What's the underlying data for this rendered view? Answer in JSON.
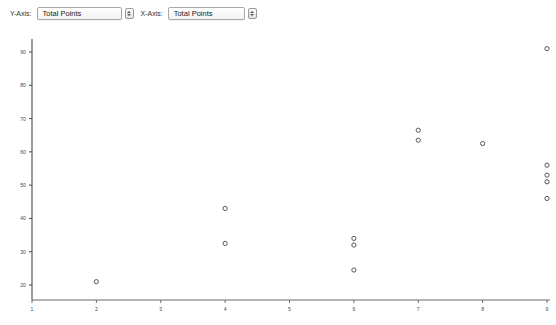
{
  "controls": {
    "y_axis": {
      "label": "Y-Axis:",
      "value": "Total Points",
      "stepper_icon": "stepper-updown-icon"
    },
    "x_axis": {
      "label": "X-Axis:",
      "value": "Total Points",
      "stepper_icon": "stepper-updown-icon"
    }
  },
  "chart_data": {
    "type": "scatter",
    "title": "",
    "xlabel": "Total Points",
    "ylabel": "Total Points",
    "xlim": [
      1,
      9
    ],
    "ylim": [
      15,
      95
    ],
    "xticks": [
      1,
      2,
      3,
      4,
      5,
      6,
      7,
      8,
      9
    ],
    "yticks": [
      20,
      30,
      40,
      50,
      60,
      70,
      80,
      90
    ],
    "xtick_labels": [
      "1",
      "2",
      "3",
      "4",
      "5",
      "6",
      "7",
      "8",
      "9"
    ],
    "ytick_labels": [
      "20",
      "30",
      "40",
      "50",
      "60",
      "70",
      "80",
      "90"
    ],
    "grid": false,
    "legend": null,
    "marker": "open-circle",
    "marker_color": "#555555",
    "axis_color": "#4a4a4a",
    "points": [
      {
        "x": 2,
        "y": 21
      },
      {
        "x": 4,
        "y": 43
      },
      {
        "x": 4,
        "y": 32.5
      },
      {
        "x": 6,
        "y": 34
      },
      {
        "x": 6,
        "y": 32
      },
      {
        "x": 6,
        "y": 24.5
      },
      {
        "x": 7,
        "y": 66.5
      },
      {
        "x": 7,
        "y": 63.5
      },
      {
        "x": 8,
        "y": 62.5
      },
      {
        "x": 9,
        "y": 91
      },
      {
        "x": 9,
        "y": 56
      },
      {
        "x": 9,
        "y": 53
      },
      {
        "x": 9,
        "y": 51
      },
      {
        "x": 9,
        "y": 46
      }
    ]
  }
}
